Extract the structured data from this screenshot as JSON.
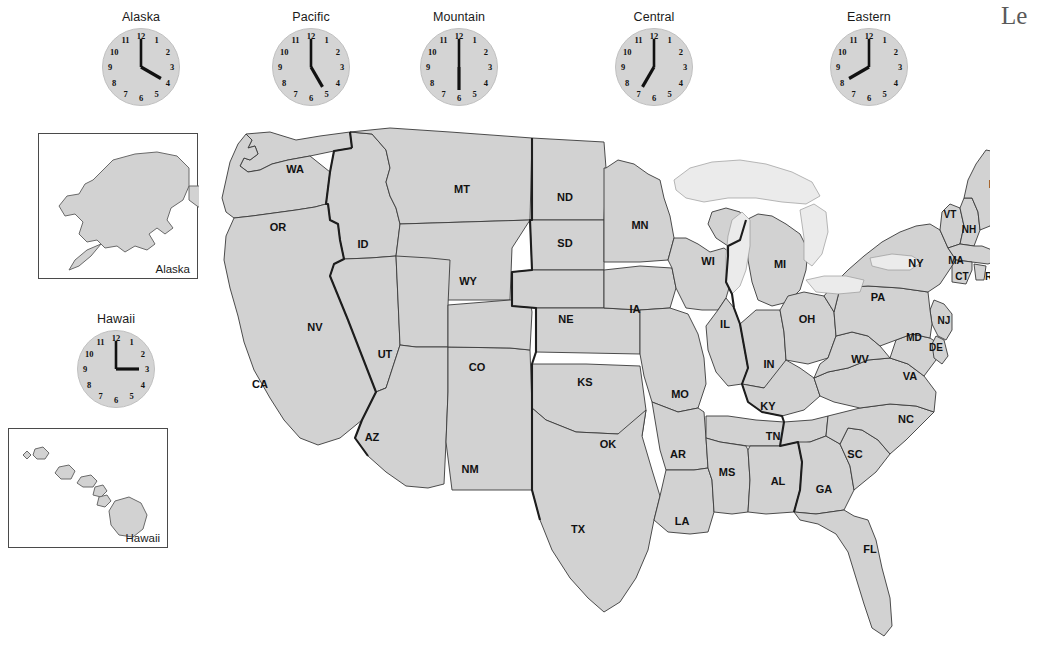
{
  "page": {
    "background_color": "#ffffff",
    "state_fill_color": "#d2d2d2",
    "state_border_color": "#3a3a3a",
    "lake_fill_color": "#ebebeb",
    "zone_border_color": "#1d1d1d",
    "clock_face_color": "#d4d4d4"
  },
  "corner_heading": {
    "text": "Le"
  },
  "clocks": [
    {
      "id": "alaska",
      "label": "Alaska",
      "time": "4:00",
      "hour": 4,
      "minute": 0,
      "left": 100,
      "top": 10
    },
    {
      "id": "pacific",
      "label": "Pacific",
      "time": "5:00",
      "hour": 5,
      "minute": 0,
      "left": 270,
      "top": 10
    },
    {
      "id": "mountain",
      "label": "Mountain",
      "time": "6:00",
      "hour": 6,
      "minute": 0,
      "left": 418,
      "top": 10
    },
    {
      "id": "central",
      "label": "Central",
      "time": "7:00",
      "hour": 7,
      "minute": 0,
      "left": 613,
      "top": 10
    },
    {
      "id": "eastern",
      "label": "Eastern",
      "time": "8:00",
      "hour": 8,
      "minute": 0,
      "left": 828,
      "top": 10
    },
    {
      "id": "hawaii",
      "label": "Hawaii",
      "time": "3:00",
      "hour": 3,
      "minute": 0,
      "left": 75,
      "top": 312
    }
  ],
  "clock_numerals": [
    "12",
    "1",
    "2",
    "3",
    "4",
    "5",
    "6",
    "7",
    "8",
    "9",
    "10",
    "11"
  ],
  "insets": [
    {
      "id": "alaska-inset",
      "label": "Alaska",
      "left": 38,
      "top": 133,
      "width": 160,
      "height": 146
    },
    {
      "id": "hawaii-inset",
      "label": "Hawaii",
      "left": 8,
      "top": 428,
      "width": 160,
      "height": 120
    }
  ],
  "states": [
    {
      "abbr": "WA",
      "name": "Washington",
      "x": 95,
      "y": 50
    },
    {
      "abbr": "OR",
      "name": "Oregon",
      "x": 78,
      "y": 108
    },
    {
      "abbr": "ID",
      "name": "Idaho",
      "x": 163,
      "y": 125
    },
    {
      "abbr": "MT",
      "name": "Montana",
      "x": 262,
      "y": 70
    },
    {
      "abbr": "WY",
      "name": "Wyoming",
      "x": 268,
      "y": 162
    },
    {
      "abbr": "NV",
      "name": "Nevada",
      "x": 115,
      "y": 208
    },
    {
      "abbr": "UT",
      "name": "Utah",
      "x": 185,
      "y": 235
    },
    {
      "abbr": "CA",
      "name": "California",
      "x": 60,
      "y": 265
    },
    {
      "abbr": "AZ",
      "name": "Arizona",
      "x": 172,
      "y": 318
    },
    {
      "abbr": "NM",
      "name": "New Mexico",
      "x": 270,
      "y": 350
    },
    {
      "abbr": "CO",
      "name": "Colorado",
      "x": 277,
      "y": 248
    },
    {
      "abbr": "ND",
      "name": "North Dakota",
      "x": 365,
      "y": 78
    },
    {
      "abbr": "SD",
      "name": "South Dakota",
      "x": 365,
      "y": 124
    },
    {
      "abbr": "NE",
      "name": "Nebraska",
      "x": 366,
      "y": 200
    },
    {
      "abbr": "KS",
      "name": "Kansas",
      "x": 385,
      "y": 263
    },
    {
      "abbr": "OK",
      "name": "Oklahoma",
      "x": 408,
      "y": 325
    },
    {
      "abbr": "TX",
      "name": "Texas",
      "x": 378,
      "y": 410
    },
    {
      "abbr": "MN",
      "name": "Minnesota",
      "x": 440,
      "y": 106
    },
    {
      "abbr": "IA",
      "name": "Iowa",
      "x": 435,
      "y": 190
    },
    {
      "abbr": "MO",
      "name": "Missouri",
      "x": 480,
      "y": 275
    },
    {
      "abbr": "AR",
      "name": "Arkansas",
      "x": 478,
      "y": 335
    },
    {
      "abbr": "LA",
      "name": "Louisiana",
      "x": 482,
      "y": 402
    },
    {
      "abbr": "WI",
      "name": "Wisconsin",
      "x": 508,
      "y": 142
    },
    {
      "abbr": "IL",
      "name": "Illinois",
      "x": 525,
      "y": 205
    },
    {
      "abbr": "MI",
      "name": "Michigan",
      "x": 580,
      "y": 145
    },
    {
      "abbr": "IN",
      "name": "Indiana",
      "x": 569,
      "y": 245
    },
    {
      "abbr": "OH",
      "name": "Ohio",
      "x": 607,
      "y": 200
    },
    {
      "abbr": "KY",
      "name": "Kentucky",
      "x": 568,
      "y": 287
    },
    {
      "abbr": "TN",
      "name": "Tennessee",
      "x": 573,
      "y": 317
    },
    {
      "abbr": "MS",
      "name": "Mississippi",
      "x": 527,
      "y": 353
    },
    {
      "abbr": "AL",
      "name": "Alabama",
      "x": 578,
      "y": 362
    },
    {
      "abbr": "GA",
      "name": "Georgia",
      "x": 624,
      "y": 370
    },
    {
      "abbr": "FL",
      "name": "Florida",
      "x": 670,
      "y": 430
    },
    {
      "abbr": "SC",
      "name": "South Carolina",
      "x": 655,
      "y": 335
    },
    {
      "abbr": "NC",
      "name": "North Carolina",
      "x": 706,
      "y": 300
    },
    {
      "abbr": "VA",
      "name": "Virginia",
      "x": 710,
      "y": 257
    },
    {
      "abbr": "WV",
      "name": "West Virginia",
      "x": 660,
      "y": 240
    },
    {
      "abbr": "MD",
      "name": "Maryland",
      "x": 714,
      "y": 218
    },
    {
      "abbr": "DE",
      "name": "Delaware",
      "x": 736,
      "y": 228
    },
    {
      "abbr": "NJ",
      "name": "New Jersey",
      "x": 744,
      "y": 201
    },
    {
      "abbr": "PA",
      "name": "Pennsylvania",
      "x": 678,
      "y": 178
    },
    {
      "abbr": "NY",
      "name": "New York",
      "x": 716,
      "y": 144
    },
    {
      "abbr": "CT",
      "name": "Connecticut",
      "x": 762,
      "y": 157
    },
    {
      "abbr": "RI",
      "name": "Rhode Island",
      "x": 790,
      "y": 157
    },
    {
      "abbr": "MA",
      "name": "Massachusetts",
      "x": 756,
      "y": 141
    },
    {
      "abbr": "VT",
      "name": "Vermont",
      "x": 750,
      "y": 95
    },
    {
      "abbr": "NH",
      "name": "New Hampshire",
      "x": 769,
      "y": 110
    },
    {
      "abbr": "ME",
      "name": "Maine",
      "x": 797,
      "y": 65
    }
  ]
}
